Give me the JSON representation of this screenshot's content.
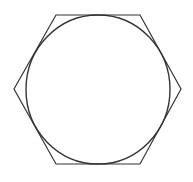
{
  "diagram": {
    "title": "",
    "stroke_color": "#333333",
    "background": "#ffffff",
    "hexagon": {
      "points": "56,15 140,15 181,89 140,164 56,164 14,89"
    },
    "circle": {
      "cx": 98,
      "cy": 89.5,
      "rx": 72,
      "ry": 74.5
    }
  }
}
